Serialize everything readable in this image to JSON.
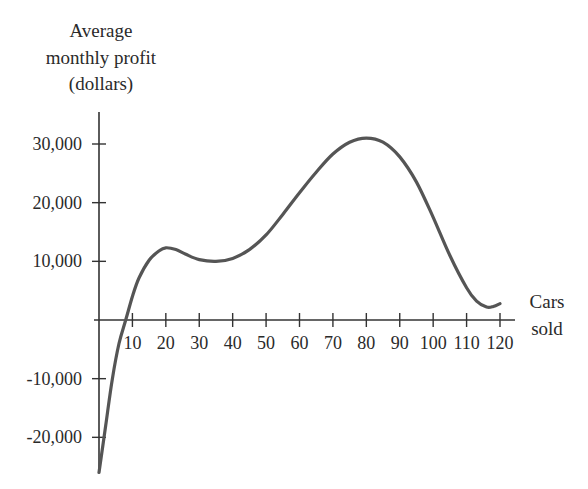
{
  "chart_data": {
    "type": "line",
    "title": "",
    "ylabel": [
      "Average",
      "monthly profit",
      "(dollars)"
    ],
    "xlabel": [
      "Cars",
      "sold"
    ],
    "x_ticks": [
      10,
      20,
      30,
      40,
      50,
      60,
      70,
      80,
      90,
      100,
      110,
      120
    ],
    "x_tick_labels": [
      "10",
      "20",
      "30",
      "40",
      "50",
      "60",
      "70",
      "80",
      "90",
      "100",
      "110",
      "120"
    ],
    "y_ticks": [
      30000,
      20000,
      10000,
      -10000,
      -20000
    ],
    "y_tick_labels": [
      "30,000",
      "20,000",
      "10,000",
      "-10,000",
      "-20,000"
    ],
    "xlim": [
      0,
      125
    ],
    "ylim": [
      -26000,
      36000
    ],
    "grid": false,
    "legend": null,
    "series": [
      {
        "name": "Average monthly profit",
        "color": "#555555",
        "x": [
          0,
          2,
          4,
          6,
          8,
          10,
          12,
          15,
          18,
          20,
          23,
          26,
          30,
          35,
          40,
          45,
          50,
          55,
          60,
          65,
          70,
          75,
          80,
          85,
          90,
          95,
          100,
          105,
          110,
          113,
          116,
          118,
          120
        ],
        "y": [
          -26000,
          -18000,
          -10000,
          -4000,
          0,
          4000,
          7200,
          10200,
          11800,
          12300,
          12000,
          11200,
          10300,
          10000,
          10500,
          12000,
          14500,
          18000,
          21700,
          25200,
          28300,
          30300,
          31000,
          30300,
          27800,
          23500,
          17500,
          11000,
          5500,
          3200,
          2200,
          2300,
          2800
        ]
      }
    ]
  }
}
